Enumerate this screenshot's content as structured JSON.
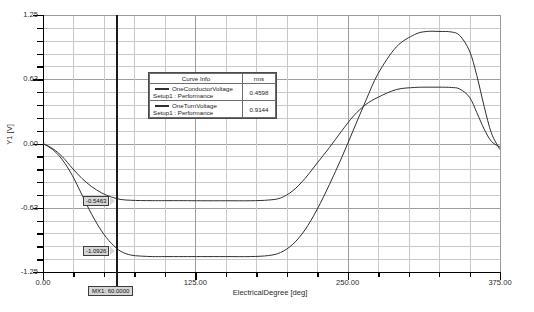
{
  "chart_data": {
    "type": "line",
    "title": "",
    "xlabel": "ElectricalDegree [deg]",
    "ylabel": "Y1 [V]",
    "xlim": [
      0,
      375
    ],
    "ylim": [
      -1.25,
      1.25
    ],
    "grid": true,
    "legend_position": "inside-upper-center",
    "x_ticks": [
      "0.00",
      "125.00",
      "250.00",
      "375.00"
    ],
    "x_tick_values": [
      0,
      125,
      250,
      375
    ],
    "y_ticks": [
      "1.25",
      "0.63",
      "0.00",
      "-0.63",
      "-1.25"
    ],
    "y_tick_values": [
      1.25,
      0.63,
      0.0,
      -0.63,
      -1.25
    ],
    "series": [
      {
        "name": "OneConductorVoltage",
        "setup": "Setup1 : Performance",
        "rms": "0.4598",
        "color": "#303030",
        "x": [
          0,
          8,
          16,
          24,
          32,
          40,
          48,
          56,
          64,
          72,
          80,
          90,
          100,
          115,
          130,
          150,
          170,
          185,
          195,
          205,
          215,
          225,
          235,
          245,
          255,
          265,
          275,
          290,
          305,
          315,
          325,
          335,
          342,
          350,
          356,
          362,
          368,
          375
        ],
        "y": [
          0.0,
          -0.05,
          -0.13,
          -0.24,
          -0.34,
          -0.42,
          -0.48,
          -0.52,
          -0.545,
          -0.552,
          -0.555,
          -0.556,
          -0.556,
          -0.556,
          -0.557,
          -0.557,
          -0.557,
          -0.55,
          -0.53,
          -0.46,
          -0.34,
          -0.19,
          -0.04,
          0.12,
          0.27,
          0.38,
          0.45,
          0.525,
          0.545,
          0.548,
          0.548,
          0.545,
          0.53,
          0.45,
          0.3,
          0.14,
          0.02,
          -0.035
        ]
      },
      {
        "name": "OneTurnVoltage",
        "setup": "Setup1 : Performance",
        "rms": "0.9144",
        "color": "#303030",
        "x": [
          0,
          8,
          16,
          24,
          32,
          40,
          48,
          56,
          64,
          72,
          80,
          90,
          100,
          115,
          130,
          150,
          170,
          185,
          195,
          205,
          215,
          225,
          235,
          245,
          255,
          265,
          275,
          290,
          305,
          315,
          325,
          335,
          342,
          350,
          356,
          362,
          368,
          375
        ],
        "y": [
          0.0,
          -0.06,
          -0.16,
          -0.31,
          -0.5,
          -0.69,
          -0.85,
          -0.97,
          -1.05,
          -1.085,
          -1.095,
          -1.1,
          -1.1,
          -1.1,
          -1.1,
          -1.1,
          -1.1,
          -1.09,
          -1.06,
          -0.98,
          -0.84,
          -0.64,
          -0.4,
          -0.14,
          0.14,
          0.42,
          0.68,
          0.94,
          1.06,
          1.09,
          1.09,
          1.085,
          1.05,
          0.9,
          0.66,
          0.36,
          0.1,
          -0.06
        ]
      }
    ],
    "legend": {
      "header_curve_info": "Curve Info",
      "header_rms": "rms",
      "rows": [
        {
          "name": "OneConductorVoltage",
          "setup": "Setup1 : Performance",
          "rms": "0.4598"
        },
        {
          "name": "OneTurnVoltage",
          "setup": "Setup1 : Performance",
          "rms": "0.9144"
        }
      ]
    },
    "markers": {
      "x_marker_label": "MX1: 60.0000",
      "x_marker_value": 60,
      "upper_value_label": "-0.5463",
      "lower_value_label": "-1.0926"
    },
    "annotations": []
  }
}
